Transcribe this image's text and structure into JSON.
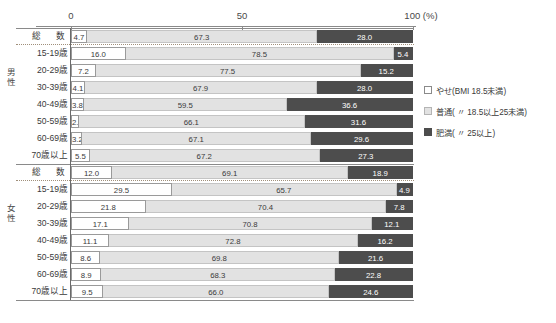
{
  "chart_data": {
    "type": "bar",
    "title": "",
    "xlabel": "100 (%)",
    "ylabel": "",
    "xlim": [
      0,
      100
    ],
    "grid": false,
    "stacked": true,
    "orientation": "horizontal",
    "legend_position": "right",
    "axis_ticks": [
      "0",
      "50",
      "100 (%)"
    ],
    "series": [
      {
        "name": "やせ(BMI 18.5未満)",
        "color": "#ffffff"
      },
      {
        "name": "普通( 〃 18.5以上25未満)",
        "color": "#e2e2e2"
      },
      {
        "name": "肥満( 〃 25以上)",
        "color": "#4d4d4d"
      }
    ],
    "groups": [
      {
        "name": "男性",
        "categories": [
          "総　数",
          "15-19歳",
          "20-29歳",
          "30-39歳",
          "40-49歳",
          "50-59歳",
          "60-69歳",
          "70歳以上"
        ],
        "values": [
          [
            4.7,
            67.3,
            28.0
          ],
          [
            16.0,
            78.5,
            5.4
          ],
          [
            7.2,
            77.5,
            15.2
          ],
          [
            4.1,
            67.9,
            28.0
          ],
          [
            3.8,
            59.5,
            36.6
          ],
          [
            2.3,
            66.1,
            31.6
          ],
          [
            3.2,
            67.1,
            29.6
          ],
          [
            5.5,
            67.2,
            27.3
          ]
        ]
      },
      {
        "name": "女性",
        "categories": [
          "総　数",
          "15-19歳",
          "20-29歳",
          "30-39歳",
          "40-49歳",
          "50-59歳",
          "60-69歳",
          "70歳以上"
        ],
        "values": [
          [
            12.0,
            69.1,
            18.9
          ],
          [
            29.5,
            65.7,
            4.9
          ],
          [
            21.8,
            70.4,
            7.8
          ],
          [
            17.1,
            70.8,
            12.1
          ],
          [
            11.1,
            72.8,
            16.2
          ],
          [
            8.6,
            69.8,
            21.6
          ],
          [
            8.9,
            68.3,
            22.8
          ],
          [
            9.5,
            66.0,
            24.6
          ]
        ]
      }
    ]
  },
  "footnote": ""
}
